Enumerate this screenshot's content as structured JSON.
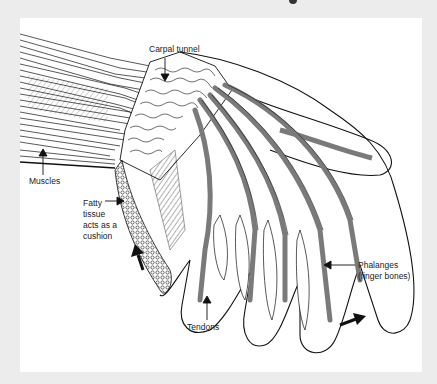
{
  "diagram": {
    "colors": {
      "background": "#ececec",
      "panel": "#ffffff",
      "line": "#111111",
      "tendon": "#7a7a7a"
    },
    "labels": {
      "carpal_tunnel": "Carpal tunnel",
      "muscles": "Muscles",
      "fatty_tissue": "Fatty\ntissue\nacts as a\ncushion",
      "phalanges": "Phalanges\n(finger bones)",
      "tendons": "Tendons"
    },
    "arrows": [
      {
        "name": "upward-motion-arrow",
        "direction": "up"
      },
      {
        "name": "rightward-motion-arrow",
        "direction": "right"
      }
    ]
  }
}
